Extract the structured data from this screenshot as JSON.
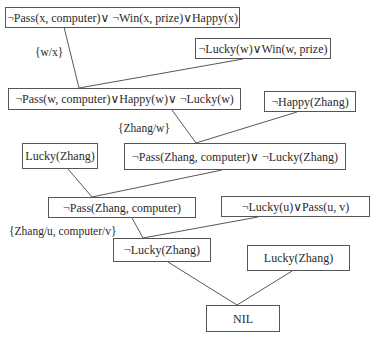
{
  "diagram": {
    "type": "resolution-refutation-tree",
    "nodes": [
      {
        "id": "c1",
        "text": "¬Pass(x, computer)∨ ¬Win(x, prize)∨Happy(x)"
      },
      {
        "id": "c2",
        "text": "¬Lucky(w)∨Win(w, prize)"
      },
      {
        "id": "c3",
        "text": "¬Pass(w, computer)∨Happy(w)∨ ¬Lucky(w)"
      },
      {
        "id": "c4",
        "text": "¬Happy(Zhang)"
      },
      {
        "id": "c5",
        "text": "Lucky(Zhang)"
      },
      {
        "id": "c6",
        "text": "¬Pass(Zhang, computer)∨ ¬Lucky(Zhang)"
      },
      {
        "id": "c7",
        "text": "¬Pass(Zhang, computer)"
      },
      {
        "id": "c8",
        "text": "¬Lucky(u)∨Pass(u, v)"
      },
      {
        "id": "c9",
        "text": "¬Lucky(Zhang)"
      },
      {
        "id": "c10",
        "text": "Lucky(Zhang)"
      },
      {
        "id": "c11",
        "text": "NIL"
      }
    ],
    "substitutions": [
      {
        "id": "s1",
        "text": "{w/x}"
      },
      {
        "id": "s2",
        "text": "{Zhang/w}"
      },
      {
        "id": "s3",
        "text": "{Zhang/u, computer/v}"
      }
    ],
    "edges": [
      {
        "from": "c1",
        "to": "c3"
      },
      {
        "from": "c2",
        "to": "c3"
      },
      {
        "from": "c3",
        "to": "c6"
      },
      {
        "from": "c4",
        "to": "c6"
      },
      {
        "from": "c5",
        "to": "c7"
      },
      {
        "from": "c6",
        "to": "c7"
      },
      {
        "from": "c7",
        "to": "c9"
      },
      {
        "from": "c8",
        "to": "c9"
      },
      {
        "from": "c9",
        "to": "c11"
      },
      {
        "from": "c10",
        "to": "c11"
      }
    ]
  }
}
